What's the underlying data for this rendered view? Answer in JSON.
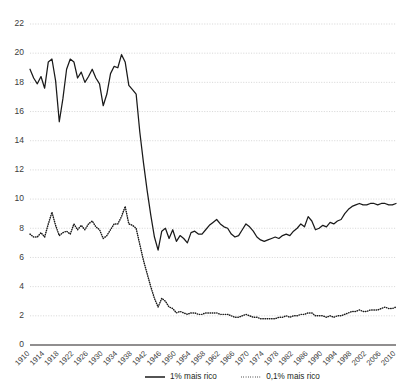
{
  "chart_data": {
    "type": "line",
    "title": "",
    "subtitle": "",
    "xlabel": "",
    "ylabel": "",
    "xlim": [
      1910,
      2010
    ],
    "ylim": [
      0,
      22
    ],
    "grid": true,
    "legend_position": "bottom",
    "y_ticks": [
      0,
      2,
      4,
      6,
      8,
      10,
      12,
      14,
      16,
      18,
      20,
      22
    ],
    "x_ticks": [
      1910,
      1914,
      1918,
      1922,
      1926,
      1930,
      1934,
      1938,
      1942,
      1946,
      1950,
      1954,
      1958,
      1962,
      1966,
      1970,
      1974,
      1978,
      1982,
      1986,
      1990,
      1994,
      1998,
      2002,
      2006,
      2010
    ],
    "x": [
      1910,
      1911,
      1912,
      1913,
      1914,
      1915,
      1916,
      1917,
      1918,
      1919,
      1920,
      1921,
      1922,
      1923,
      1924,
      1925,
      1926,
      1927,
      1928,
      1929,
      1930,
      1931,
      1932,
      1933,
      1934,
      1935,
      1936,
      1937,
      1938,
      1939,
      1940,
      1941,
      1942,
      1943,
      1944,
      1945,
      1946,
      1947,
      1948,
      1949,
      1950,
      1951,
      1952,
      1953,
      1954,
      1955,
      1956,
      1957,
      1958,
      1959,
      1960,
      1961,
      1962,
      1963,
      1964,
      1965,
      1966,
      1967,
      1968,
      1969,
      1970,
      1971,
      1972,
      1973,
      1974,
      1975,
      1976,
      1977,
      1978,
      1979,
      1980,
      1981,
      1982,
      1983,
      1984,
      1985,
      1986,
      1987,
      1988,
      1989,
      1990,
      1991,
      1992,
      1993,
      1994,
      1995,
      1996,
      1997,
      1998,
      1999,
      2000,
      2001,
      2002,
      2003,
      2004,
      2005,
      2006,
      2007,
      2008,
      2009,
      2010
    ],
    "series": [
      {
        "name": "1% mais rico",
        "style": "solid",
        "color": "#1a1a1a",
        "values": [
          18.9,
          18.3,
          17.9,
          18.4,
          17.6,
          19.4,
          19.6,
          18.1,
          15.3,
          16.9,
          18.9,
          19.6,
          19.4,
          18.3,
          18.7,
          18.0,
          18.4,
          18.9,
          18.3,
          17.9,
          16.4,
          17.2,
          18.6,
          19.1,
          19.0,
          19.9,
          19.4,
          17.8,
          17.5,
          17.2,
          14.6,
          12.5,
          10.6,
          8.9,
          7.4,
          6.5,
          7.8,
          8.0,
          7.3,
          7.9,
          7.1,
          7.5,
          7.3,
          7.0,
          7.7,
          7.8,
          7.6,
          7.6,
          7.9,
          8.2,
          8.4,
          8.6,
          8.3,
          8.1,
          8.0,
          7.6,
          7.4,
          7.5,
          7.9,
          8.3,
          8.1,
          7.8,
          7.4,
          7.2,
          7.1,
          7.2,
          7.3,
          7.4,
          7.3,
          7.5,
          7.6,
          7.5,
          7.8,
          8.0,
          8.3,
          8.1,
          8.8,
          8.5,
          7.9,
          8.0,
          8.2,
          8.1,
          8.4,
          8.3,
          8.5,
          8.6,
          9.0,
          9.3,
          9.5,
          9.6,
          9.7,
          9.6,
          9.6,
          9.7,
          9.7,
          9.6,
          9.7,
          9.7,
          9.6,
          9.6,
          9.7
        ]
      },
      {
        "name": "0,1% mais rico",
        "style": "dotted",
        "color": "#1a1a1a",
        "values": [
          7.6,
          7.4,
          7.4,
          7.7,
          7.4,
          8.3,
          9.1,
          8.2,
          7.5,
          7.7,
          7.8,
          7.6,
          8.3,
          7.9,
          8.2,
          7.9,
          8.3,
          8.5,
          8.1,
          7.9,
          7.3,
          7.5,
          7.9,
          8.3,
          8.3,
          8.8,
          9.5,
          8.3,
          8.2,
          8.0,
          6.9,
          5.8,
          4.9,
          4.0,
          3.2,
          2.6,
          3.2,
          3.0,
          2.6,
          2.5,
          2.2,
          2.3,
          2.2,
          2.1,
          2.2,
          2.2,
          2.1,
          2.1,
          2.2,
          2.2,
          2.2,
          2.2,
          2.1,
          2.1,
          2.1,
          2.0,
          1.9,
          1.9,
          2.0,
          2.1,
          2.0,
          1.9,
          1.9,
          1.8,
          1.8,
          1.8,
          1.8,
          1.8,
          1.9,
          1.9,
          2.0,
          1.9,
          2.0,
          2.0,
          2.1,
          2.1,
          2.2,
          2.2,
          2.0,
          2.0,
          2.0,
          1.9,
          2.0,
          1.9,
          2.0,
          2.0,
          2.1,
          2.2,
          2.3,
          2.3,
          2.4,
          2.3,
          2.3,
          2.4,
          2.4,
          2.4,
          2.5,
          2.6,
          2.5,
          2.5,
          2.6
        ]
      }
    ],
    "legend": [
      {
        "label": "1% mais rico",
        "style": "solid"
      },
      {
        "label": "0,1% mais rico",
        "style": "dotted"
      }
    ]
  }
}
